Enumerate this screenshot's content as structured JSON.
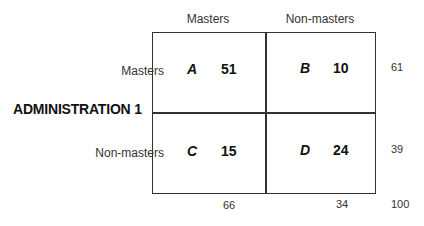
{
  "columns": {
    "masters_label": "Masters",
    "nonmasters_label": "Non-masters"
  },
  "rows": {
    "axis_label": "ADMINISTRATION 1",
    "masters_label": "Masters",
    "nonmasters_label": "Non-masters"
  },
  "cells": [
    {
      "letter": "A",
      "value": "51"
    },
    {
      "letter": "B",
      "value": "10"
    },
    {
      "letter": "C",
      "value": "15"
    },
    {
      "letter": "D",
      "value": "24"
    }
  ],
  "row_totals": [
    "61",
    "39"
  ],
  "col_totals": [
    "66",
    "34"
  ],
  "grand_total": "100"
}
